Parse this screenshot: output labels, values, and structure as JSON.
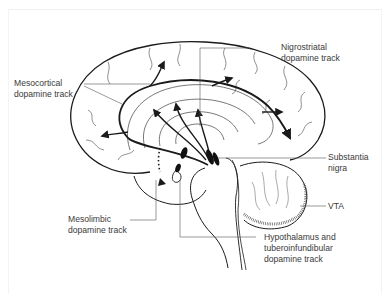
{
  "diagram": {
    "colors": {
      "line": "#1a1a1a",
      "text": "#3a3a3a",
      "leader": "#555555",
      "background": "#ffffff"
    },
    "labels": {
      "mesocortical": {
        "line1": "Mesocortical",
        "line2": "dopamine track"
      },
      "nigrostriatal": {
        "line1": "Nigrostriatal",
        "line2": "dopamine track"
      },
      "substantia_nigra": {
        "line1": "Substantia",
        "line2": "nigra"
      },
      "vta": {
        "line1": "VTA"
      },
      "mesolimbic": {
        "line1": "Mesolimbic",
        "line2": "dopamine track"
      },
      "hypothalamus": {
        "line1": "Hypothalamus and",
        "line2": "tuberoinfundibular",
        "line3": "dopamine track"
      }
    }
  }
}
